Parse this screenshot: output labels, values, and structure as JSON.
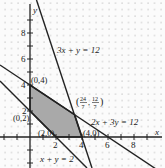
{
  "figure": {
    "type": "linear-programming-feasible-region",
    "axes": {
      "x_label": "x",
      "y_label": "y",
      "x_ticks": [
        "2",
        "4",
        "6",
        "8"
      ],
      "y_ticks": [
        "2",
        "4",
        "6",
        "8"
      ]
    },
    "lines": [
      {
        "label": "3x + y = 12"
      },
      {
        "label": "2x + 3y = 12"
      },
      {
        "label": "x + y = 2"
      }
    ],
    "vertices": [
      {
        "label": "(0,4)"
      },
      {
        "label": "(0,2)"
      },
      {
        "label": "(2,0)"
      },
      {
        "label": "(4,0)"
      },
      {
        "label_num_x": "24",
        "label_den_x": "7",
        "label_num_y": "12",
        "label_den_y": "7"
      }
    ],
    "colors": {
      "shade": "#a9a9a9",
      "line": "#222222",
      "grid_dot": "#9a9a9a"
    }
  }
}
